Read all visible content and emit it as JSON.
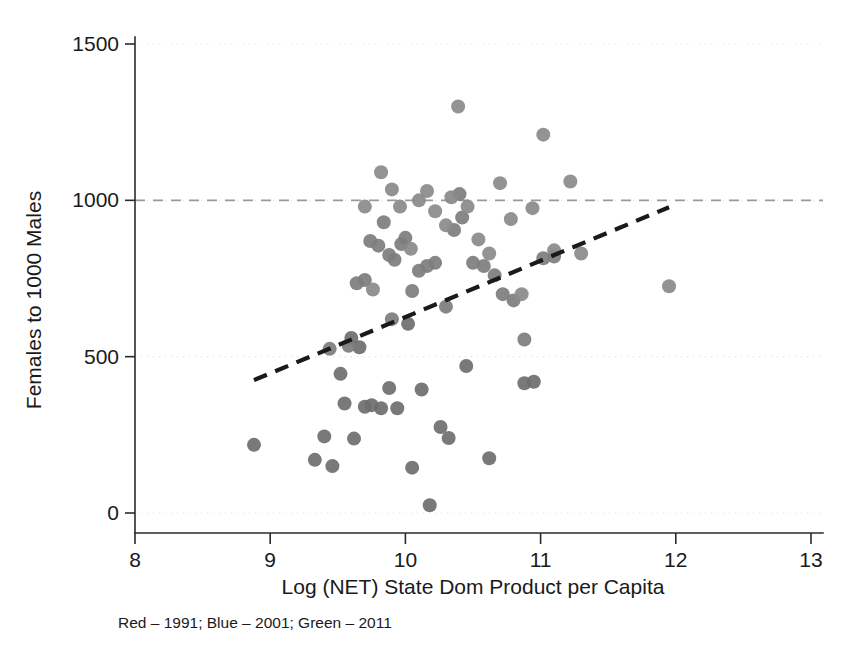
{
  "chart_data": {
    "type": "scatter",
    "title": "",
    "xlabel": "Log (NET) State Dom Product per Capita",
    "ylabel": "Females to 1000 Males",
    "xlim": [
      8,
      13
    ],
    "ylim": [
      0,
      1500
    ],
    "xticks": [
      8,
      9,
      10,
      11,
      12,
      13
    ],
    "yticks": [
      0,
      500,
      1000,
      1500
    ],
    "xtick_labels": [
      "8",
      "9",
      "10",
      "11",
      "12",
      "13"
    ],
    "ytick_labels": [
      "0",
      "500",
      "1000",
      "1500"
    ],
    "grid": false,
    "legend": "none",
    "caption": "Red – 1991; Blue – 2001; Green – 2011",
    "reference_line": {
      "orientation": "horizontal",
      "y": 1000,
      "style": "dashed",
      "color": "#9a9a9a"
    },
    "fit_line": {
      "style": "dashed",
      "color": "#1a1a1a",
      "x_start": 8.88,
      "y_start": 425,
      "x_end": 11.95,
      "y_end": 978
    },
    "series": [
      {
        "name": "1991",
        "legend_color_name": "Red",
        "rendered_color": "#6e6e6e",
        "points": [
          [
            8.88,
            218
          ],
          [
            9.33,
            170
          ],
          [
            9.4,
            245
          ],
          [
            9.46,
            150
          ],
          [
            9.55,
            350
          ],
          [
            9.62,
            238
          ],
          [
            9.66,
            530
          ],
          [
            9.7,
            340
          ],
          [
            9.75,
            345
          ],
          [
            9.82,
            335
          ],
          [
            9.88,
            400
          ],
          [
            9.94,
            335
          ],
          [
            10.05,
            145
          ],
          [
            10.12,
            395
          ],
          [
            10.18,
            25
          ],
          [
            10.26,
            275
          ],
          [
            10.32,
            240
          ],
          [
            10.45,
            470
          ],
          [
            10.62,
            175
          ],
          [
            10.88,
            415
          ],
          [
            10.95,
            420
          ],
          [
            9.52,
            445
          ],
          [
            10.02,
            605
          ],
          [
            9.6,
            560
          ]
        ]
      },
      {
        "name": "2001",
        "legend_color_name": "Blue",
        "rendered_color": "#7d7d7d",
        "points": [
          [
            9.44,
            525
          ],
          [
            9.58,
            535
          ],
          [
            9.64,
            735
          ],
          [
            9.7,
            745
          ],
          [
            9.74,
            870
          ],
          [
            9.8,
            855
          ],
          [
            9.84,
            930
          ],
          [
            9.88,
            825
          ],
          [
            9.92,
            810
          ],
          [
            9.97,
            860
          ],
          [
            10.0,
            880
          ],
          [
            10.05,
            710
          ],
          [
            10.1,
            775
          ],
          [
            10.16,
            790
          ],
          [
            10.22,
            800
          ],
          [
            10.3,
            660
          ],
          [
            10.36,
            905
          ],
          [
            10.42,
            945
          ],
          [
            10.5,
            800
          ],
          [
            10.58,
            790
          ],
          [
            10.66,
            760
          ],
          [
            10.72,
            700
          ],
          [
            10.8,
            680
          ],
          [
            10.88,
            555
          ],
          [
            11.02,
            815
          ],
          [
            11.1,
            820
          ],
          [
            9.9,
            620
          ],
          [
            10.4,
            1020
          ]
        ]
      },
      {
        "name": "2011",
        "legend_color_name": "Green",
        "rendered_color": "#8a8a8a",
        "points": [
          [
            9.7,
            980
          ],
          [
            9.76,
            715
          ],
          [
            9.82,
            1090
          ],
          [
            9.9,
            1035
          ],
          [
            9.96,
            980
          ],
          [
            10.04,
            845
          ],
          [
            10.1,
            1000
          ],
          [
            10.16,
            1030
          ],
          [
            10.22,
            965
          ],
          [
            10.3,
            920
          ],
          [
            10.34,
            1010
          ],
          [
            10.39,
            1300
          ],
          [
            10.46,
            980
          ],
          [
            10.54,
            875
          ],
          [
            10.62,
            830
          ],
          [
            10.7,
            1055
          ],
          [
            10.78,
            940
          ],
          [
            10.86,
            700
          ],
          [
            11.02,
            1210
          ],
          [
            11.1,
            840
          ],
          [
            11.22,
            1060
          ],
          [
            11.3,
            830
          ],
          [
            11.95,
            725
          ],
          [
            10.94,
            975
          ]
        ]
      }
    ],
    "n_points": 76,
    "marker_radius_px": 7
  },
  "axes": {
    "y_axis_title": "Females to 1000 Males",
    "x_axis_title": "Log (NET) State Dom Product per Capita"
  },
  "caption": {
    "text": "Red – 1991; Blue – 2001; Green – 2011"
  },
  "colors": {
    "background": "#ffffff",
    "axis": "#2b2b2b",
    "reference_line": "#9a9a9a",
    "fit_line": "#1a1a1a",
    "series_1991": "#6e6e6e",
    "series_2001": "#7d7d7d",
    "series_2011": "#8a8a8a"
  }
}
